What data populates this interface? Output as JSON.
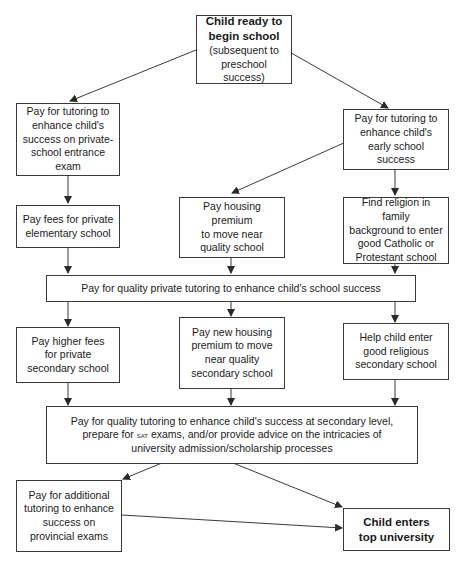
{
  "diagram": {
    "type": "flowchart",
    "nodes": {
      "start": {
        "title_line1": "Child ready to",
        "title_line2": "begin school",
        "subtitle_line1": "(subsequent to",
        "subtitle_line2": "preschool success)"
      },
      "private_tutoring_exam": {
        "line1": "Pay for tutoring to",
        "line2": "enhance child's",
        "line3": "success on private-",
        "line4": "school entrance exam"
      },
      "early_tutoring": {
        "line1": "Pay for tutoring to",
        "line2": "enhance child's",
        "line3": "early school success"
      },
      "private_elementary": {
        "line1": "Pay fees for private",
        "line2": "elementary school"
      },
      "housing_premium": {
        "line1": "Pay housing premium",
        "line2": "to move near",
        "line3": "quality school"
      },
      "religion": {
        "line1": "Find religion in family",
        "line2": "background to enter",
        "line3": "good Catholic or",
        "line4": "Protestant school"
      },
      "quality_private_tutoring": {
        "line1": "Pay for quality private tutoring to enhance child's school success"
      },
      "private_secondary": {
        "line1": "Pay higher fees",
        "line2": "for private",
        "line3": "secondary school"
      },
      "new_housing_premium": {
        "line1": "Pay new housing",
        "line2": "premium to move",
        "line3": "near quality",
        "line4": "secondary school"
      },
      "religious_secondary": {
        "line1": "Help child enter",
        "line2": "good religious",
        "line3": "secondary school"
      },
      "secondary_tutoring": {
        "line1_a": "Pay for quality tutoring to enhance child's success at secondary level,",
        "line2_a": "prepare for ",
        "line2_sat": "SAT",
        "line2_b": " exams, and/or provide advice on the intricacies of",
        "line3": "university admission/scholarship processes"
      },
      "provincial_exams": {
        "line1": "Pay for additional",
        "line2": "tutoring to enhance",
        "line3": "success on",
        "line4": "provincial exams"
      },
      "end": {
        "line1": "Child enters",
        "line2": "top university"
      }
    },
    "edges": [
      [
        "start",
        "private_tutoring_exam"
      ],
      [
        "start",
        "early_tutoring"
      ],
      [
        "private_tutoring_exam",
        "private_elementary"
      ],
      [
        "early_tutoring",
        "housing_premium"
      ],
      [
        "early_tutoring",
        "religion"
      ],
      [
        "private_elementary",
        "quality_private_tutoring"
      ],
      [
        "housing_premium",
        "quality_private_tutoring"
      ],
      [
        "religion",
        "quality_private_tutoring"
      ],
      [
        "quality_private_tutoring",
        "private_secondary"
      ],
      [
        "quality_private_tutoring",
        "new_housing_premium"
      ],
      [
        "quality_private_tutoring",
        "religious_secondary"
      ],
      [
        "private_secondary",
        "secondary_tutoring"
      ],
      [
        "new_housing_premium",
        "secondary_tutoring"
      ],
      [
        "religious_secondary",
        "secondary_tutoring"
      ],
      [
        "secondary_tutoring",
        "provincial_exams"
      ],
      [
        "secondary_tutoring",
        "end"
      ],
      [
        "provincial_exams",
        "end"
      ]
    ],
    "colors": {
      "stroke": "#3a3a3a",
      "background": "#ffffff",
      "text": "#1a1a1a"
    }
  }
}
